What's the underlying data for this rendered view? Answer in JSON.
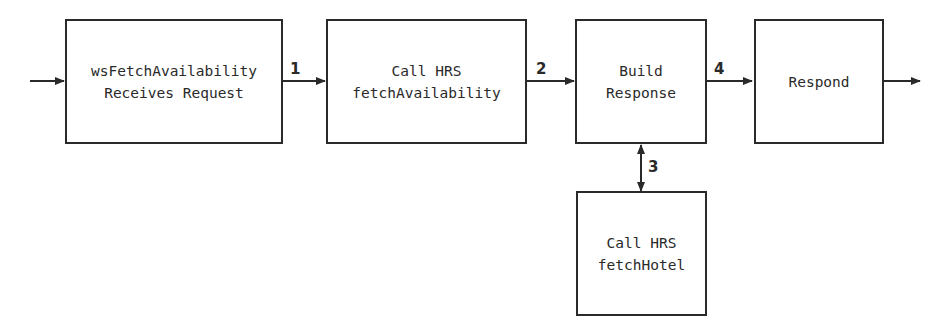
{
  "diagram": {
    "type": "flowchart",
    "nodes": [
      {
        "id": "receive",
        "lines": [
          "wsFetchAvailability",
          "Receives Request"
        ]
      },
      {
        "id": "call_fetch_availability",
        "lines": [
          "Call HRS",
          "fetchAvailability"
        ]
      },
      {
        "id": "build_response",
        "lines": [
          "Build",
          "Response"
        ]
      },
      {
        "id": "respond",
        "lines": [
          "Respond"
        ]
      },
      {
        "id": "call_fetch_hotel",
        "lines": [
          "Call HRS",
          "fetchHotel"
        ]
      }
    ],
    "edges": [
      {
        "from": "input",
        "to": "receive",
        "label": ""
      },
      {
        "from": "receive",
        "to": "call_fetch_availability",
        "label": "1"
      },
      {
        "from": "call_fetch_availability",
        "to": "build_response",
        "label": "2"
      },
      {
        "from": "build_response",
        "to": "call_fetch_hotel",
        "label": "3",
        "bidirectional": true
      },
      {
        "from": "build_response",
        "to": "respond",
        "label": "4"
      },
      {
        "from": "respond",
        "to": "output",
        "label": ""
      }
    ]
  }
}
